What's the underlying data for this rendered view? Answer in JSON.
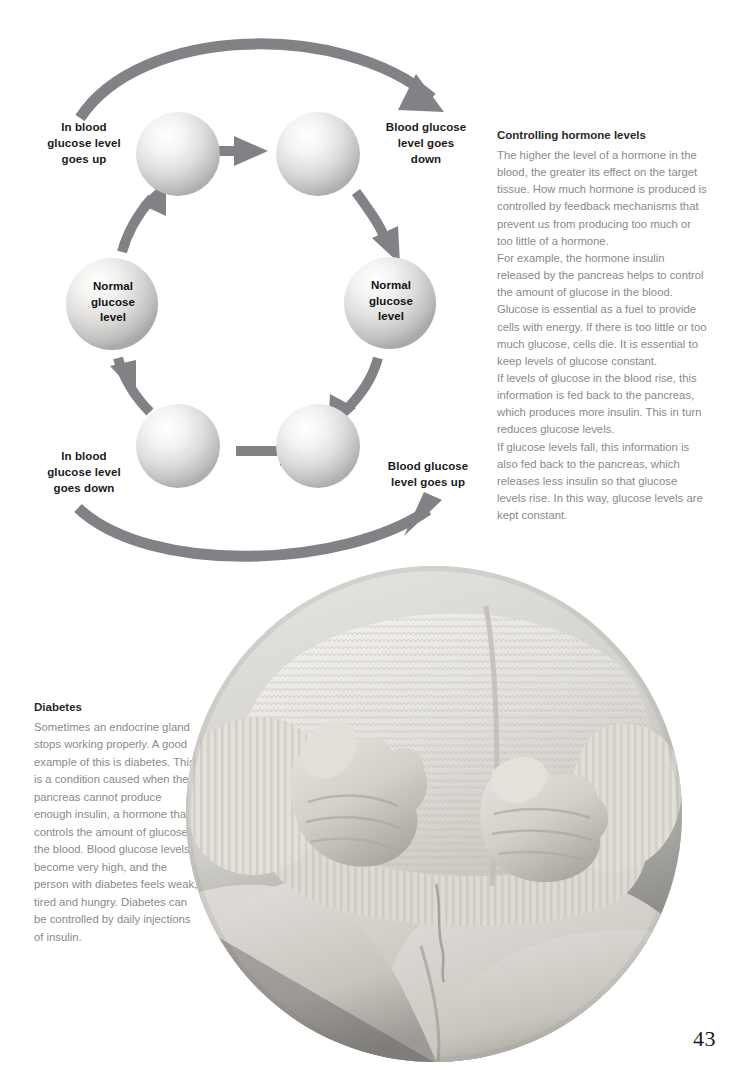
{
  "page": {
    "number": "43",
    "background_color": "#ffffff",
    "body_text_color": "#8a8a8a",
    "heading_color": "#2a2a2a",
    "arrow_color": "#808285"
  },
  "diagram": {
    "name": "blood-glucose-feedback-cycle",
    "labels": {
      "top_left": "In blood\nglucose level\ngoes up",
      "top_left_lines": [
        "In blood",
        "glucose level",
        "goes up"
      ],
      "top_right": "Blood glucose\nlevel goes\ndown",
      "top_right_lines": [
        "Blood glucose",
        "level goes",
        "down"
      ],
      "bottom_left": "In blood\nglucose level\ngoes down",
      "bottom_left_lines": [
        "In blood",
        "glucose level",
        "goes down"
      ],
      "bottom_right": "Blood glucose\nlevel goes up",
      "bottom_right_lines": [
        "Blood glucose",
        "level goes up"
      ]
    },
    "spheres": {
      "left_center_lines": [
        "Normal",
        "glucose",
        "level"
      ],
      "right_center_lines": [
        "Normal",
        "glucose",
        "level"
      ],
      "blank_count": 4
    }
  },
  "hormone_section": {
    "heading": "Controlling hormone levels",
    "paragraphs": [
      "The higher the level of a hormone in the blood, the greater its effect on the target tissue. How much hormone is produced is controlled by feedback mechanisms that prevent us from producing too much or too little of a hormone.",
      "For example, the hormone insulin released by the pancreas helps to control the amount of glucose in the blood. Glucose is essential as a fuel to provide cells with energy. If there is too little or too much glucose, cells die. It is essential to keep levels of glucose constant.",
      "If levels of glucose in the blood rise, this information is fed back to the pancreas, which produces more insulin. This in turn reduces glucose levels.",
      "If glucose levels fall, this information is also fed back to the pancreas, which releases less insulin so that glucose levels rise. In this way, glucose levels are kept constant."
    ]
  },
  "diabetes_section": {
    "heading": "Diabetes",
    "paragraphs": [
      "Sometimes an endocrine gland stops working properly. A good example of this is diabetes. This is a condition caused when the pancreas cannot produce enough insulin, a hormone that controls the amount of glucose in the blood. Blood glucose levels become very high, and the person with diabetes feels weak, tired and hungry. Diabetes can be controlled by daily injections of insulin."
    ]
  },
  "photo": {
    "caption_alt": "child in knitted sweater with hands resting on knees",
    "shape": "circle"
  }
}
